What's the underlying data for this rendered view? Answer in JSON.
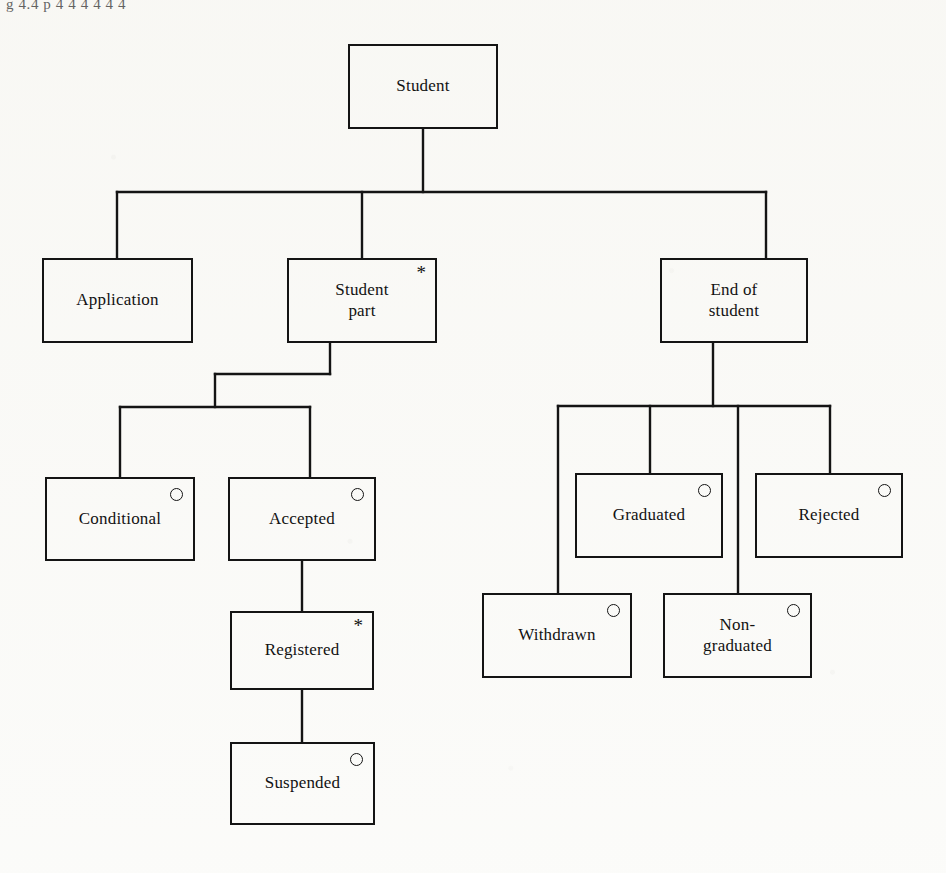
{
  "diagram": {
    "type": "hierarchy-tree",
    "top_fragment_text": "g 4.4 p 4 4 4 4 4 4",
    "line_color": "#141414",
    "text_color": "#121212",
    "background_color": "#fbfbf9",
    "marker_legend": {
      "iteration_symbol": "*",
      "selection_symbol": "o"
    },
    "nodes": [
      {
        "id": "student",
        "label": "Student",
        "marker": "none",
        "level": 0,
        "x": 348,
        "y": 44,
        "w": 150,
        "h": 85
      },
      {
        "id": "application",
        "label": "Application",
        "marker": "none",
        "level": 1,
        "x": 42,
        "y": 258,
        "w": 151,
        "h": 85
      },
      {
        "id": "student-part",
        "label": "Student\npart",
        "marker": "iteration",
        "level": 1,
        "x": 287,
        "y": 258,
        "w": 150,
        "h": 85
      },
      {
        "id": "end-of-student",
        "label": "End of\nstudent",
        "marker": "none",
        "level": 1,
        "x": 660,
        "y": 258,
        "w": 148,
        "h": 85
      },
      {
        "id": "conditional",
        "label": "Conditional",
        "marker": "selection",
        "level": 2,
        "x": 45,
        "y": 477,
        "w": 150,
        "h": 84
      },
      {
        "id": "accepted",
        "label": "Accepted",
        "marker": "selection",
        "level": 2,
        "x": 228,
        "y": 477,
        "w": 148,
        "h": 84
      },
      {
        "id": "graduated",
        "label": "Graduated",
        "marker": "selection",
        "level": 2,
        "x": 575,
        "y": 473,
        "w": 148,
        "h": 85
      },
      {
        "id": "rejected",
        "label": "Rejected",
        "marker": "selection",
        "level": 2,
        "x": 755,
        "y": 473,
        "w": 148,
        "h": 85
      },
      {
        "id": "withdrawn",
        "label": "Withdrawn",
        "marker": "selection",
        "level": 2,
        "x": 482,
        "y": 593,
        "w": 150,
        "h": 85
      },
      {
        "id": "non-graduated",
        "label": "Non-\ngraduated",
        "marker": "selection",
        "level": 2,
        "x": 663,
        "y": 593,
        "w": 149,
        "h": 85
      },
      {
        "id": "registered",
        "label": "Registered",
        "marker": "iteration",
        "level": 3,
        "x": 230,
        "y": 611,
        "w": 144,
        "h": 79
      },
      {
        "id": "suspended",
        "label": "Suspended",
        "marker": "selection",
        "level": 4,
        "x": 230,
        "y": 742,
        "w": 145,
        "h": 83
      }
    ],
    "edges": [
      {
        "from": "student",
        "to": "application"
      },
      {
        "from": "student",
        "to": "student-part"
      },
      {
        "from": "student",
        "to": "end-of-student"
      },
      {
        "from": "student-part",
        "to": "conditional"
      },
      {
        "from": "student-part",
        "to": "accepted"
      },
      {
        "from": "accepted",
        "to": "registered"
      },
      {
        "from": "registered",
        "to": "suspended"
      },
      {
        "from": "end-of-student",
        "to": "withdrawn"
      },
      {
        "from": "end-of-student",
        "to": "graduated"
      },
      {
        "from": "end-of-student",
        "to": "non-graduated"
      },
      {
        "from": "end-of-student",
        "to": "rejected"
      }
    ]
  }
}
